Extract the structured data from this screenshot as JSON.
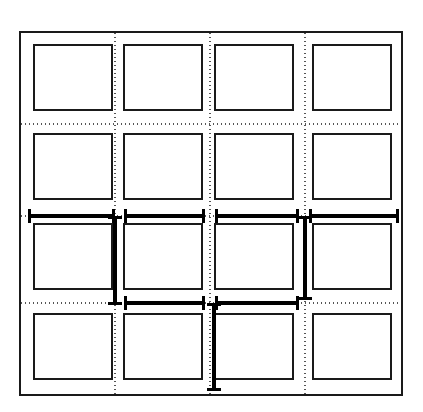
{
  "diagram": {
    "type": "technical-line-drawing",
    "canvas": {
      "width": 423,
      "height": 412,
      "background": "#ffffff"
    },
    "colors": {
      "stroke": "#1a1a1a",
      "panel_fill": "#ffffff",
      "grid_dotted": "#555555",
      "dimension": "#000000"
    },
    "outer_frame": {
      "label": "outer boundary rectangle",
      "x": 20,
      "y": 32,
      "width": 382,
      "height": 363,
      "stroke_width": 2.2
    },
    "panel_grid": {
      "label": "4 by 4 panel array",
      "rows": 4,
      "columns": 4,
      "stroke_width": 2.0,
      "column_x": [
        34,
        124,
        215,
        313
      ],
      "column_width": [
        78,
        78,
        78,
        78
      ],
      "row_y": [
        45,
        134,
        224,
        314
      ],
      "row_height": [
        65,
        65,
        65,
        65
      ],
      "cell_labels": [
        [
          "panel-r1c1",
          "panel-r1c2",
          "panel-r1c3",
          "panel-r1c4"
        ],
        [
          "panel-r2c1",
          "panel-r2c2",
          "panel-r2c3",
          "panel-r2c4"
        ],
        [
          "panel-r3c1",
          "panel-r3c2",
          "panel-r3c3",
          "panel-r3c4"
        ],
        [
          "panel-r4c1",
          "panel-r4c2",
          "panel-r4c3",
          "panel-r4c4"
        ]
      ]
    },
    "grid_lines": {
      "label": "dotted centerline grid",
      "stroke_width": 1.1,
      "dash_pattern": "1 3",
      "vertical_x": [
        115,
        210,
        305
      ],
      "horizontal_y": [
        124,
        216,
        303
      ],
      "extent": {
        "x1": 21,
        "x2": 401,
        "y1": 33,
        "y2": 394
      }
    },
    "dimension_lines": {
      "label": "bold dimension callouts with end ticks",
      "bar_stroke_width": 4.0,
      "tick_stroke_width": 3.0,
      "tick_half_length": 7,
      "horizontal": [
        {
          "name": "dim-h-row3-span1",
          "y": 216,
          "x1": 29,
          "x2": 113
        },
        {
          "name": "dim-h-row3-span2",
          "y": 216,
          "x1": 125,
          "x2": 203
        },
        {
          "name": "dim-h-row3-span3",
          "y": 216,
          "x1": 216,
          "x2": 297
        },
        {
          "name": "dim-h-row3-span4",
          "y": 216,
          "x1": 310,
          "x2": 397
        },
        {
          "name": "dim-h-row4-span1",
          "y": 303,
          "x1": 125,
          "x2": 203
        },
        {
          "name": "dim-h-row4-span2",
          "y": 303,
          "x1": 216,
          "x2": 297
        }
      ],
      "vertical": [
        {
          "name": "dim-v-col1-row3",
          "x": 115,
          "y1": 217,
          "y2": 303
        },
        {
          "name": "dim-v-col3-row3",
          "x": 305,
          "y1": 217,
          "y2": 298
        },
        {
          "name": "dim-v-col2-row4",
          "x": 214,
          "y1": 304,
          "y2": 389
        }
      ]
    }
  }
}
